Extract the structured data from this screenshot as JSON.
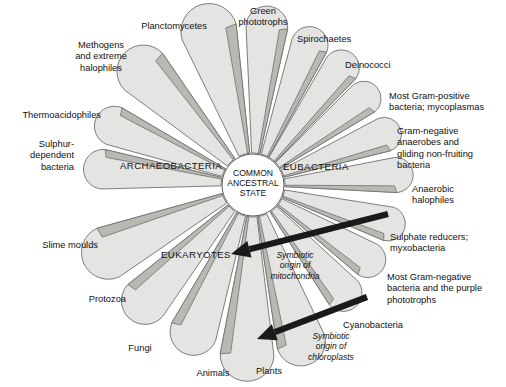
{
  "figure": {
    "kind": "radial-phylogenetic-fan",
    "width": 506,
    "height": 387,
    "background_color": "#ffffff",
    "fan_fill_color": "#e4e4e2",
    "fan_shade_color": "#b9b9b4",
    "outline_color": "#6f6f6d",
    "arrow_color": "#1a1a1a"
  },
  "hub": {
    "label": "COMMON\nANCESTRAL\nSTATE",
    "center_x": 253,
    "center_y": 185,
    "radius": 31
  },
  "domains": [
    {
      "name": "archaeobacteria",
      "label": "ARCHAEOBACTERIA",
      "x": 120,
      "y": 160
    },
    {
      "name": "eubacteria",
      "label": "EUBACTERIA",
      "x": 283,
      "y": 161
    },
    {
      "name": "eukaryotes",
      "label": "EUKARYOTES",
      "x": 161,
      "y": 249
    }
  ],
  "branches": [
    {
      "id": "sulphur-dependent-bacteria",
      "domain": "archaeobacteria",
      "label": "Sulphur-\ndependent\nbacteria",
      "angle_deg": 186,
      "label_x": 8,
      "label_y": 139,
      "label_w": 66,
      "align": "right"
    },
    {
      "id": "thermoacidophiles",
      "domain": "archaeobacteria",
      "label": "Thermoacidophiles",
      "angle_deg": 203,
      "label_x": 4,
      "label_y": 110,
      "label_w": 97,
      "align": "right"
    },
    {
      "id": "methogens-extreme-halophiles",
      "domain": "archaeobacteria",
      "label": "Methogens\nand extreme\nhalophiles",
      "angle_deg": 226,
      "label_x": 62,
      "label_y": 40,
      "label_w": 78,
      "align": "center"
    },
    {
      "id": "planctomycetes",
      "domain": "archaeobacteria",
      "label": "Planctomycetes",
      "angle_deg": 254,
      "label_x": 133,
      "label_y": 21,
      "label_w": 82,
      "align": "center"
    },
    {
      "id": "green-phototrophs",
      "domain": "eubacteria",
      "label": "Green\nphototrophs",
      "angle_deg": 275,
      "label_x": 228,
      "label_y": 6,
      "label_w": 70,
      "align": "center"
    },
    {
      "id": "spirochaetes",
      "domain": "eubacteria",
      "label": "Spirochaetes",
      "angle_deg": 292,
      "label_x": 297,
      "label_y": 34,
      "label_w": 72,
      "align": "left"
    },
    {
      "id": "deinococci",
      "domain": "eubacteria",
      "label": "Deinococci",
      "angle_deg": 307,
      "label_x": 345,
      "label_y": 60,
      "label_w": 62,
      "align": "left"
    },
    {
      "id": "most-gram-positive-bacteria",
      "domain": "eubacteria",
      "label": "Most Gram-positive\nbacteria; mycoplasmas",
      "angle_deg": 322,
      "label_x": 389,
      "label_y": 91,
      "label_w": 115,
      "align": "left"
    },
    {
      "id": "gram-negative-anaerobes",
      "domain": "eubacteria",
      "label": "Gram-negative\nanaerobes and\ngliding non-fruiting\nbacteria",
      "angle_deg": 339,
      "label_x": 397,
      "label_y": 126,
      "label_w": 106,
      "align": "left"
    },
    {
      "id": "anaerobic-halophiles",
      "domain": "eubacteria",
      "label": "Anaerobic\nhalophiles",
      "angle_deg": 356,
      "label_x": 412,
      "label_y": 184,
      "label_w": 78,
      "align": "left"
    },
    {
      "id": "sulphate-reducers-myxobacteria",
      "domain": "eubacteria",
      "label": "Sulphate reducers;\nmyxobacteria",
      "angle_deg": 16,
      "label_x": 390,
      "label_y": 232,
      "label_w": 112,
      "align": "left"
    },
    {
      "id": "most-gram-negative-purple",
      "domain": "eubacteria",
      "label": "Most Gram-negative\nbacteria and the purple\nphototrophs",
      "angle_deg": 33,
      "label_x": 387,
      "label_y": 272,
      "label_w": 118,
      "align": "left"
    },
    {
      "id": "cyanobacteria",
      "domain": "eubacteria",
      "label": "Cyanobacteria",
      "angle_deg": 50,
      "label_x": 343,
      "label_y": 320,
      "label_w": 80,
      "align": "left"
    },
    {
      "id": "plants",
      "domain": "eukaryotes",
      "label": "Plants",
      "angle_deg": 73,
      "label_x": 246,
      "label_y": 366,
      "label_w": 46,
      "align": "center"
    },
    {
      "id": "animals",
      "domain": "eukaryotes",
      "label": "Animals",
      "angle_deg": 92,
      "label_x": 188,
      "label_y": 368,
      "label_w": 50,
      "align": "center"
    },
    {
      "id": "fungi",
      "domain": "eukaryotes",
      "label": "Fungi",
      "angle_deg": 112,
      "label_x": 118,
      "label_y": 343,
      "label_w": 44,
      "align": "center"
    },
    {
      "id": "protozoa",
      "domain": "eukaryotes",
      "label": "Protozoa",
      "angle_deg": 133,
      "label_x": 68,
      "label_y": 294,
      "label_w": 58,
      "align": "right"
    },
    {
      "id": "slime-moulds",
      "domain": "eukaryotes",
      "label": "Slime moulds",
      "angle_deg": 155,
      "label_x": 20,
      "label_y": 240,
      "label_w": 78,
      "align": "right"
    }
  ],
  "annotations": [
    {
      "id": "symbiotic-origin-mitochondria",
      "text": "Symbiotic\norigin of\nmitochondria",
      "label_x": 253,
      "label_y": 250,
      "label_w": 84,
      "arrow_from_x": 388,
      "arrow_from_y": 214,
      "arrow_to_x": 231,
      "arrow_to_y": 254
    },
    {
      "id": "symbiotic-origin-chloroplasts",
      "text": "Symbiotic\norigin of\nchloroplasts",
      "label_x": 289,
      "label_y": 331,
      "label_w": 84,
      "arrow_from_x": 367,
      "arrow_from_y": 297,
      "arrow_to_x": 257,
      "arrow_to_y": 339
    }
  ]
}
